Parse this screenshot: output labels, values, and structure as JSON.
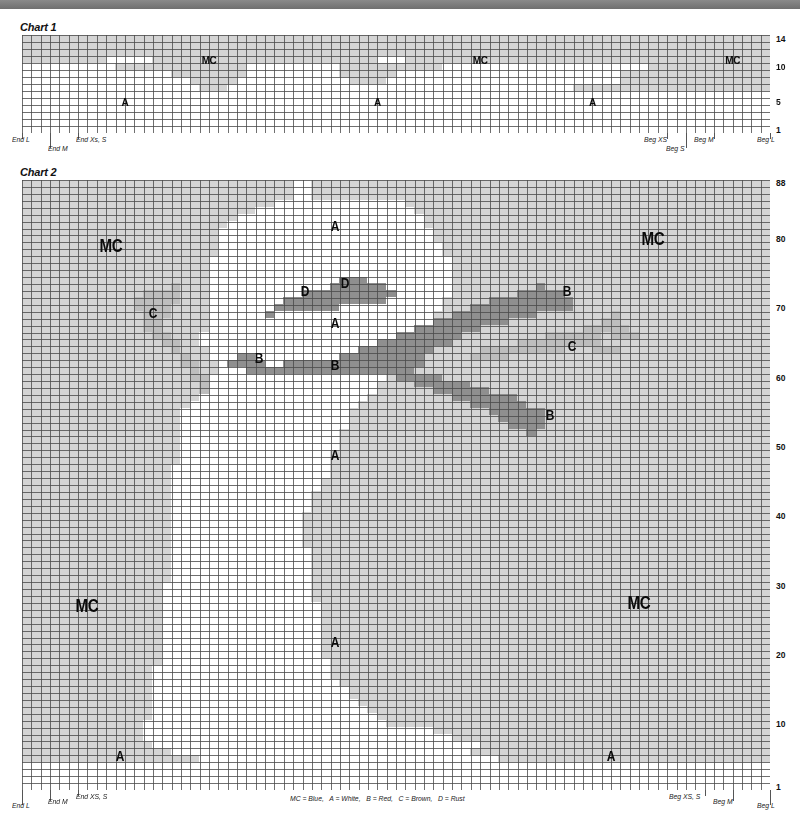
{
  "colors": {
    "MC": "#d4d4d4",
    "A": "#ffffff",
    "B": "#8f8f8f",
    "C": "#bdbdbd",
    "D": "#8f8f8f",
    "gridline": "#4a4a4a",
    "topbar": "#7a7a7a"
  },
  "chart1": {
    "title": "Chart 1",
    "cols": 80,
    "rows": 14,
    "x": 22,
    "y": 35,
    "width": 748,
    "height": 98,
    "row_labels": [
      {
        "row": 14,
        "label": "14"
      },
      {
        "row": 10,
        "label": "10"
      },
      {
        "row": 5,
        "label": "5"
      },
      {
        "row": 1,
        "label": "1"
      }
    ],
    "region_rows_top_to_bottom": [
      "MC:80",
      "MC:80",
      "MC:80",
      "MC:9,A:5,MC:24,A:3,MC:39",
      "A:10,MC:14,A:10,MC:11,A:22,MC:13",
      "A:16,MC:8,A:10,MC:6,A:24,MC:16",
      "A:18,MC:5,A:12,MC:4,A:25,MC:16",
      "A:19,MC:3,A:37,MC:21",
      "A:80",
      "A:80",
      "A:80",
      "A:80",
      "A:80",
      "A:80"
    ],
    "labels": [
      {
        "text": "MC",
        "col": 20,
        "row": 3.5,
        "size": "small"
      },
      {
        "text": "MC",
        "col": 49,
        "row": 3.5,
        "size": "small"
      },
      {
        "text": "MC",
        "col": 76,
        "row": 3.5,
        "size": "small"
      },
      {
        "text": "A",
        "col": 11,
        "row": 9.5,
        "size": "small"
      },
      {
        "text": "A",
        "col": 38,
        "row": 9.5,
        "size": "small"
      },
      {
        "text": "A",
        "col": 61,
        "row": 9.5,
        "size": "small"
      }
    ],
    "size_markers": [
      {
        "text": "End L",
        "col": 0,
        "level": 0,
        "side": "left"
      },
      {
        "text": "End M",
        "col": 3,
        "level": 1,
        "side": "left"
      },
      {
        "text": "End Xs, S",
        "col": 6,
        "level": 0,
        "side": "left"
      },
      {
        "text": "Beg XS",
        "col": 69,
        "level": 0,
        "side": "right"
      },
      {
        "text": "Beg S",
        "col": 71,
        "level": 1,
        "side": "right"
      },
      {
        "text": "Beg M",
        "col": 74,
        "level": 0,
        "side": "right"
      },
      {
        "text": "Beg L",
        "col": 80,
        "level": 0,
        "side": "right"
      }
    ]
  },
  "chart2": {
    "title": "Chart 2",
    "cols": 80,
    "rows": 88,
    "x": 22,
    "y": 180,
    "width": 748,
    "height": 610,
    "row_labels": [
      {
        "row": 88,
        "label": "88"
      },
      {
        "row": 80,
        "label": "80"
      },
      {
        "row": 70,
        "label": "70"
      },
      {
        "row": 60,
        "label": "60"
      },
      {
        "row": 50,
        "label": "50"
      },
      {
        "row": 40,
        "label": "40"
      },
      {
        "row": 30,
        "label": "30"
      },
      {
        "row": 20,
        "label": "20"
      },
      {
        "row": 10,
        "label": "10"
      },
      {
        "row": 1,
        "label": "1"
      }
    ],
    "a_bounds_top_to_bottom": [
      [
        29,
        31
      ],
      [
        29,
        31
      ],
      [
        29,
        31
      ],
      [
        27,
        41
      ],
      [
        25,
        42
      ],
      [
        23,
        43
      ],
      [
        22,
        43
      ],
      [
        21,
        44
      ],
      [
        21,
        44
      ],
      [
        21,
        45
      ],
      [
        21,
        45
      ],
      [
        20,
        46
      ],
      [
        20,
        46
      ],
      [
        20,
        46
      ],
      [
        20,
        46
      ],
      [
        20,
        46
      ],
      [
        20,
        46
      ],
      [
        20,
        45
      ],
      [
        20,
        45
      ],
      [
        20,
        44
      ],
      [
        20,
        44
      ],
      [
        20,
        43
      ],
      [
        19,
        42
      ],
      [
        19,
        41
      ],
      [
        20,
        40
      ],
      [
        20,
        40
      ],
      [
        21,
        40
      ],
      [
        21,
        40
      ],
      [
        20,
        39
      ],
      [
        20,
        38
      ],
      [
        20,
        38
      ],
      [
        19,
        37
      ],
      [
        18,
        36
      ],
      [
        17,
        35
      ],
      [
        17,
        35
      ],
      [
        17,
        35
      ],
      [
        17,
        34
      ],
      [
        17,
        34
      ],
      [
        17,
        34
      ],
      [
        17,
        33
      ],
      [
        17,
        33
      ],
      [
        16,
        33
      ],
      [
        16,
        33
      ],
      [
        16,
        32
      ],
      [
        16,
        32
      ],
      [
        16,
        31
      ],
      [
        16,
        31
      ],
      [
        16,
        31
      ],
      [
        16,
        30
      ],
      [
        16,
        30
      ],
      [
        16,
        30
      ],
      [
        16,
        30
      ],
      [
        16,
        30
      ],
      [
        16,
        31
      ],
      [
        16,
        31
      ],
      [
        16,
        31
      ],
      [
        16,
        31
      ],
      [
        16,
        31
      ],
      [
        15,
        31
      ],
      [
        15,
        31
      ],
      [
        15,
        31
      ],
      [
        15,
        32
      ],
      [
        15,
        32
      ],
      [
        15,
        32
      ],
      [
        15,
        32
      ],
      [
        15,
        32
      ],
      [
        15,
        32
      ],
      [
        15,
        32
      ],
      [
        15,
        32
      ],
      [
        15,
        33
      ],
      [
        14,
        33
      ],
      [
        14,
        33
      ],
      [
        14,
        34
      ],
      [
        14,
        35
      ],
      [
        14,
        35
      ],
      [
        14,
        36
      ],
      [
        14,
        37
      ],
      [
        14,
        38
      ],
      [
        13,
        39
      ],
      [
        13,
        44
      ],
      [
        13,
        46
      ],
      [
        14,
        49
      ],
      [
        16,
        52
      ],
      [
        19,
        53
      ],
      [
        0,
        80
      ],
      [
        0,
        80
      ],
      [
        0,
        80
      ],
      [
        0,
        80
      ]
    ],
    "overlays": [
      {
        "color": "D",
        "cells": [
          [
            14,
            34
          ],
          [
            14,
            35
          ],
          [
            14,
            36
          ],
          [
            15,
            33
          ],
          [
            15,
            34
          ],
          [
            15,
            35
          ],
          [
            15,
            36
          ],
          [
            15,
            37
          ],
          [
            15,
            38
          ],
          [
            16,
            30
          ],
          [
            16,
            31
          ],
          [
            16,
            32
          ],
          [
            16,
            33
          ],
          [
            16,
            34
          ],
          [
            16,
            35
          ],
          [
            16,
            36
          ],
          [
            16,
            37
          ],
          [
            16,
            38
          ],
          [
            16,
            39
          ],
          [
            17,
            28
          ],
          [
            17,
            29
          ],
          [
            17,
            30
          ],
          [
            17,
            31
          ],
          [
            17,
            32
          ],
          [
            17,
            33
          ],
          [
            17,
            34
          ],
          [
            17,
            35
          ],
          [
            17,
            36
          ],
          [
            17,
            37
          ],
          [
            17,
            38
          ],
          [
            18,
            27
          ],
          [
            18,
            28
          ],
          [
            18,
            29
          ],
          [
            18,
            30
          ],
          [
            18,
            31
          ],
          [
            18,
            32
          ],
          [
            18,
            33
          ],
          [
            19,
            26
          ]
        ]
      },
      {
        "color": "B",
        "rows": [
          [
            15,
            55,
            56
          ],
          [
            16,
            53,
            58
          ],
          [
            17,
            50,
            59
          ],
          [
            18,
            48,
            59
          ],
          [
            19,
            46,
            55
          ],
          [
            20,
            44,
            52
          ],
          [
            21,
            42,
            49
          ],
          [
            22,
            40,
            47
          ],
          [
            23,
            38,
            46
          ],
          [
            24,
            36,
            44
          ],
          [
            25,
            23,
            25
          ],
          [
            25,
            34,
            43
          ],
          [
            26,
            22,
            26
          ],
          [
            26,
            28,
            43
          ],
          [
            27,
            24,
            42
          ],
          [
            28,
            40,
            45
          ],
          [
            29,
            42,
            48
          ],
          [
            30,
            44,
            50
          ],
          [
            31,
            46,
            53
          ],
          [
            32,
            48,
            54
          ],
          [
            33,
            50,
            56
          ],
          [
            34,
            51,
            56
          ],
          [
            35,
            52,
            56
          ],
          [
            36,
            54,
            55
          ]
        ]
      },
      {
        "color": "C",
        "rows": [
          [
            15,
            16,
            17
          ],
          [
            16,
            13,
            17
          ],
          [
            17,
            12,
            17
          ],
          [
            18,
            12,
            16
          ],
          [
            19,
            13,
            16
          ],
          [
            20,
            13,
            15
          ],
          [
            21,
            13,
            15
          ],
          [
            22,
            14,
            16
          ],
          [
            23,
            15,
            17
          ],
          [
            24,
            16,
            17
          ],
          [
            25,
            17,
            18
          ],
          [
            26,
            17,
            19
          ],
          [
            27,
            18,
            19
          ],
          [
            28,
            18,
            20
          ],
          [
            29,
            19,
            20
          ],
          [
            30,
            19,
            20
          ],
          [
            19,
            63,
            64
          ],
          [
            20,
            62,
            64
          ],
          [
            21,
            60,
            65
          ],
          [
            22,
            56,
            62
          ],
          [
            22,
            63,
            66
          ],
          [
            23,
            53,
            62
          ],
          [
            24,
            49,
            58
          ],
          [
            24,
            61,
            64
          ],
          [
            25,
            48,
            52
          ]
        ]
      }
    ],
    "labels": [
      {
        "text": "A",
        "col": 33.5,
        "row": 6.5,
        "size": "mid"
      },
      {
        "text": "MC",
        "col": 9.5,
        "row": 9.5,
        "size": "big"
      },
      {
        "text": "MC",
        "col": 67.5,
        "row": 8.5,
        "size": "big"
      },
      {
        "text": "D",
        "col": 30.3,
        "row": 15.8,
        "size": "mid"
      },
      {
        "text": "D",
        "col": 34.5,
        "row": 14.7,
        "size": "mid"
      },
      {
        "text": "B",
        "col": 58.3,
        "row": 15.8,
        "size": "mid"
      },
      {
        "text": "C",
        "col": 14,
        "row": 19,
        "size": "mid"
      },
      {
        "text": "A",
        "col": 33.5,
        "row": 20.5,
        "size": "mid"
      },
      {
        "text": "C",
        "col": 58.8,
        "row": 23.8,
        "size": "mid"
      },
      {
        "text": "B",
        "col": 25.3,
        "row": 25.5,
        "size": "mid"
      },
      {
        "text": "B",
        "col": 33.5,
        "row": 26.5,
        "size": "mid"
      },
      {
        "text": "B",
        "col": 56.5,
        "row": 33.8,
        "size": "mid"
      },
      {
        "text": "A",
        "col": 33.5,
        "row": 39.5,
        "size": "mid"
      },
      {
        "text": "MC",
        "col": 7,
        "row": 61.5,
        "size": "big"
      },
      {
        "text": "MC",
        "col": 66,
        "row": 61,
        "size": "big"
      },
      {
        "text": "A",
        "col": 33.5,
        "row": 66.5,
        "size": "mid"
      },
      {
        "text": "A",
        "col": 10.5,
        "row": 83,
        "size": "mid"
      },
      {
        "text": "A",
        "col": 63,
        "row": 83,
        "size": "mid"
      }
    ],
    "extra_mc_bottom": [
      [
        80,
        0,
        13
      ],
      [
        80,
        49,
        80
      ],
      [
        81,
        0,
        14
      ],
      [
        81,
        49,
        56
      ],
      [
        81,
        58,
        80
      ],
      [
        82,
        0,
        16
      ],
      [
        82,
        48,
        52
      ],
      [
        82,
        56,
        59
      ],
      [
        82,
        63,
        70
      ],
      [
        83,
        0,
        19
      ],
      [
        83,
        51,
        58
      ]
    ],
    "size_markers": [
      {
        "text": "End L",
        "col": 0,
        "level": 1,
        "side": "left"
      },
      {
        "text": "End M",
        "col": 3,
        "level": 0.5,
        "side": "left"
      },
      {
        "text": "End XS, S",
        "col": 6,
        "level": 0,
        "side": "left"
      },
      {
        "text": "Beg XS, S",
        "col": 73,
        "level": 0,
        "side": "right"
      },
      {
        "text": "Beg M",
        "col": 76,
        "level": 0.5,
        "side": "right"
      },
      {
        "text": "Beg L",
        "col": 80,
        "level": 1,
        "side": "right"
      }
    ],
    "legend": "MC = Blue,   A = White,   B = Red,   C = Brown,   D = Rust"
  }
}
